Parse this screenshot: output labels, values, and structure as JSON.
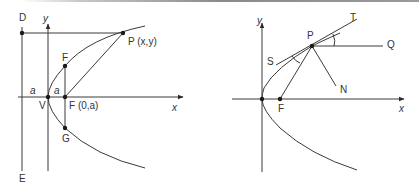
{
  "colors": {
    "stroke": "#3a3a3a",
    "text": "#333333",
    "top_bar": "#9a9a9a"
  },
  "left_diagram": {
    "title": "Parabola definition with focus and directrix",
    "labels": {
      "directrix_top": "D",
      "directrix_bottom": "E",
      "y_axis": "y",
      "x_axis": "x",
      "vertex": "V",
      "focus": "F (0,a)",
      "latus_top": "F",
      "latus_bottom": "G",
      "point": "P (x,y)",
      "dist_left": "a",
      "dist_right": "a"
    }
  },
  "right_diagram": {
    "title": "Reflection property of parabola",
    "labels": {
      "y_axis": "y",
      "x_axis": "x",
      "focus": "F",
      "point": "P",
      "tangent_end": "T",
      "tangent_start": "S",
      "horizontal": "Q",
      "normal": "N"
    }
  }
}
